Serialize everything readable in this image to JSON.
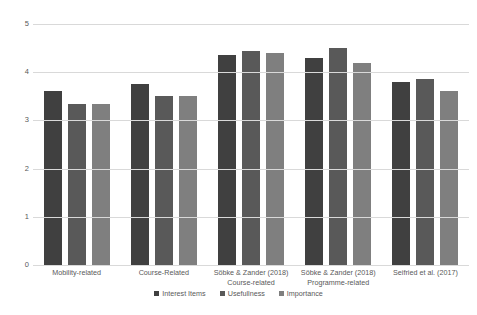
{
  "chart_data": {
    "type": "bar",
    "title": "",
    "subtitle": "",
    "xlabel": "",
    "ylabel": "",
    "ylim": [
      0,
      5
    ],
    "yticks": [
      "0",
      "1",
      "2",
      "3",
      "4",
      "5"
    ],
    "grid": true,
    "legend_position": "bottom",
    "categories": [
      "Mobility-related",
      "Course-Related",
      "Söbke & Zander (2018) Course-related",
      "Söbke & Zander (2018) Programme-related",
      "Seifried et al. (2017)"
    ],
    "category_lines": [
      {
        "line1": "Mobility-related",
        "line2": ""
      },
      {
        "line1": "Course-Related",
        "line2": ""
      },
      {
        "line1": "Söbke & Zander (2018)",
        "line2": "Course-related"
      },
      {
        "line1": "Söbke & Zander (2018)",
        "line2": "Programme-related"
      },
      {
        "line1": "Seifried et al. (2017)",
        "line2": ""
      }
    ],
    "series": [
      {
        "name": "Interest Items",
        "color": "#404040",
        "values": [
          3.6,
          3.75,
          4.35,
          4.3,
          3.8
        ]
      },
      {
        "name": "Usefullness",
        "color": "#595959",
        "values": [
          3.35,
          3.5,
          4.45,
          4.5,
          3.85
        ]
      },
      {
        "name": "Importance",
        "color": "#7f7f7f",
        "values": [
          3.35,
          3.5,
          4.4,
          4.2,
          3.6
        ]
      }
    ]
  },
  "legend": {
    "items": [
      {
        "label": "Interest Items"
      },
      {
        "label": "Usefullness"
      },
      {
        "label": "Importance"
      }
    ]
  },
  "colors": {
    "series_1": "#404040",
    "series_2": "#595959",
    "series_3": "#7f7f7f",
    "gridline": "#d9d9d9",
    "text": "#595959",
    "background": "#ffffff"
  }
}
